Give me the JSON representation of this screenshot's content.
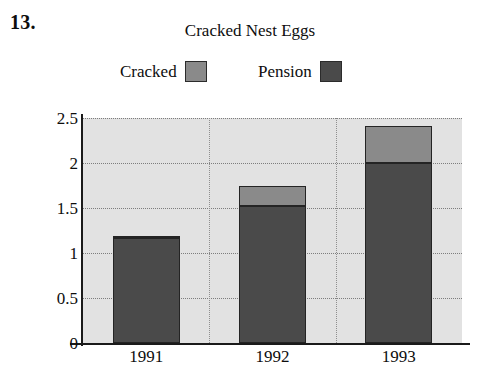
{
  "question_number": "13.",
  "chart_data": {
    "type": "bar",
    "subtype": "stacked",
    "title": "Cracked Nest Eggs",
    "xlabel": "",
    "ylabel": "",
    "categories": [
      "1991",
      "1992",
      "1993"
    ],
    "series": [
      {
        "name": "Pension",
        "color": "#4a4a4a",
        "values": [
          1.17,
          1.52,
          2.0
        ]
      },
      {
        "name": "Cracked",
        "color": "#8a8a8a",
        "values": [
          0.02,
          0.22,
          0.41
        ]
      }
    ],
    "stack_order": [
      "Pension",
      "Cracked"
    ],
    "totals": [
      1.19,
      1.74,
      2.41
    ],
    "ylim": [
      0,
      2.5
    ],
    "yticks": [
      0,
      0.5,
      1,
      1.5,
      2,
      2.5
    ],
    "ytick_labels": [
      "0",
      "0.5",
      "1",
      "1.5",
      "2",
      "2.5"
    ],
    "grid": true,
    "grid_style": "dotted",
    "legend_position": "top",
    "legend_entries": [
      {
        "label": "Cracked",
        "color": "#8a8a8a"
      },
      {
        "label": "Pension",
        "color": "#4a4a4a"
      }
    ],
    "plot_background": "#e2e2e2"
  }
}
